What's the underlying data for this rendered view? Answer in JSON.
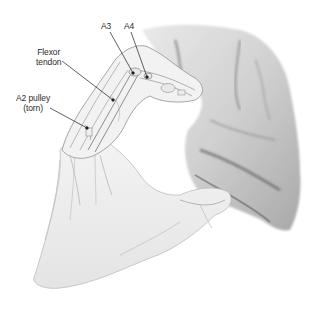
{
  "figure": {
    "background_color": "#ffffff",
    "ink_color": "#2a2a2a"
  },
  "labels": [
    {
      "id": "a3",
      "text": "A3",
      "x": 103,
      "y": 20,
      "target": [
        133,
        73
      ]
    },
    {
      "id": "a4",
      "text": "A4",
      "x": 125,
      "y": 20,
      "target": [
        147,
        77
      ]
    },
    {
      "id": "flexor",
      "lines": [
        "Flexor",
        "tendon"
      ],
      "x": 38,
      "y": 46,
      "target": [
        113,
        100
      ]
    },
    {
      "id": "a2",
      "lines": [
        "A2 pulley",
        "(torn)"
      ],
      "x": 18,
      "y": 92,
      "target": [
        87,
        128
      ]
    }
  ]
}
